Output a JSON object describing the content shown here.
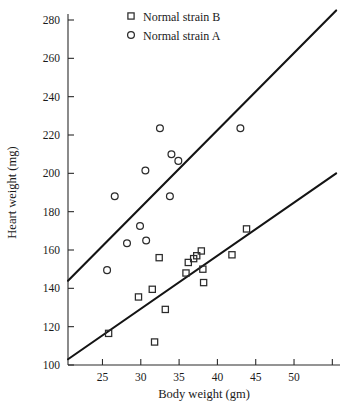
{
  "chart_data": {
    "type": "scatter",
    "title": "",
    "xlabel": "Body weight (gm)",
    "ylabel": "Heart weight (mg)",
    "xlim": [
      20.5,
      56.0
    ],
    "ylim": [
      100,
      284
    ],
    "xticks": [
      25,
      30,
      35,
      40,
      45,
      50,
      55
    ],
    "xticklabels": [
      "25",
      "30",
      "35",
      "40",
      "45",
      "50",
      ""
    ],
    "yticks": [
      100,
      120,
      140,
      160,
      180,
      200,
      220,
      240,
      260,
      280
    ],
    "yticklabels": [
      "100",
      "120",
      "140",
      "160",
      "180",
      "200",
      "220",
      "240",
      "260",
      "280"
    ],
    "grid": false,
    "legend_position": "top-center",
    "series": [
      {
        "name": "Normal strain B",
        "marker": "square",
        "points": [
          {
            "x": 25.8,
            "y": 116.5
          },
          {
            "x": 29.7,
            "y": 135.5
          },
          {
            "x": 31.5,
            "y": 139.5
          },
          {
            "x": 31.8,
            "y": 112.0
          },
          {
            "x": 32.4,
            "y": 156.0
          },
          {
            "x": 33.2,
            "y": 129.0
          },
          {
            "x": 35.9,
            "y": 148.0
          },
          {
            "x": 36.2,
            "y": 153.5
          },
          {
            "x": 36.9,
            "y": 155.5
          },
          {
            "x": 37.3,
            "y": 157.0
          },
          {
            "x": 37.9,
            "y": 159.5
          },
          {
            "x": 38.1,
            "y": 150.0
          },
          {
            "x": 38.2,
            "y": 143.0
          },
          {
            "x": 41.9,
            "y": 157.5
          },
          {
            "x": 43.8,
            "y": 171.0
          }
        ]
      },
      {
        "name": "Normal strain A",
        "marker": "circle",
        "points": [
          {
            "x": 25.6,
            "y": 149.5
          },
          {
            "x": 26.6,
            "y": 188.0
          },
          {
            "x": 28.2,
            "y": 163.5
          },
          {
            "x": 29.9,
            "y": 172.5
          },
          {
            "x": 30.7,
            "y": 165.0
          },
          {
            "x": 30.6,
            "y": 201.5
          },
          {
            "x": 32.5,
            "y": 223.5
          },
          {
            "x": 33.8,
            "y": 188.0
          },
          {
            "x": 34.0,
            "y": 210.0
          },
          {
            "x": 34.9,
            "y": 206.5
          },
          {
            "x": 43.0,
            "y": 223.5
          }
        ]
      }
    ],
    "fit_lines": [
      {
        "name": "strain A regression",
        "x0": 20.5,
        "y0": 144.0,
        "x1": 55.5,
        "y1": 285.0
      },
      {
        "name": "strain B regression",
        "x0": 20.5,
        "y0": 103.0,
        "x1": 55.5,
        "y1": 200.0
      }
    ]
  },
  "legend": {
    "entries": [
      {
        "label": "Normal strain B",
        "marker": "square"
      },
      {
        "label": "Normal strain A",
        "marker": "circle"
      }
    ]
  }
}
